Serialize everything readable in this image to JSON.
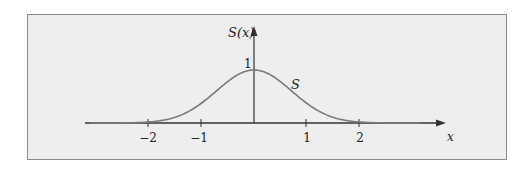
{
  "chart_data": {
    "type": "line",
    "title": "",
    "xlabel": "x",
    "ylabel": "S(x)",
    "curve_label": "S",
    "xticks": [
      -2,
      -1,
      1,
      2
    ],
    "xtick_labels": [
      "−2",
      "−1",
      "1",
      "2"
    ],
    "ytick_labels": [
      "1"
    ],
    "xlim": [
      -3.2,
      3.6
    ],
    "ylim": [
      0,
      1.4
    ],
    "grid": false,
    "legend": "none",
    "series": [
      {
        "name": "S",
        "description": "Gaussian-like bell curve S(x) = exp(-x^2), peak 1 at x=0",
        "x": [
          -2,
          -1.5,
          -1,
          -0.5,
          0,
          0.5,
          1,
          1.5,
          2
        ],
        "values": [
          0.02,
          0.11,
          0.37,
          0.78,
          1.0,
          0.78,
          0.37,
          0.11,
          0.02
        ]
      }
    ],
    "colors": {
      "curve": "#7a7a7a",
      "axes": "#333333",
      "background": "#eeeeee",
      "frame": "#8a8a8a"
    }
  },
  "labels": {
    "y_axis": "S(x)",
    "x_axis": "x",
    "curve": "S",
    "y_one": "1",
    "tick_m2": "−2",
    "tick_m1": "−1",
    "tick_1": "1",
    "tick_2": "2"
  }
}
